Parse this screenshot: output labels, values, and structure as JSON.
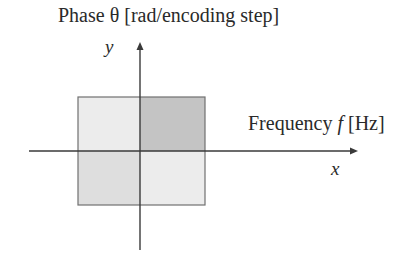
{
  "diagram": {
    "title": "Phase θ [rad/encoding step]",
    "y_axis_label": "y",
    "x_axis_title_prefix": "Frequency ",
    "x_axis_title_symbol": "f",
    "x_axis_title_suffix": " [Hz]",
    "x_axis_label": "x",
    "quadrants": {
      "top_left": {
        "shade": "very-light",
        "color": "#ececec"
      },
      "top_right": {
        "shade": "dark",
        "color": "#c4c4c4"
      },
      "bottom_left": {
        "shade": "medium-light",
        "color": "#dedede"
      },
      "bottom_right": {
        "shade": "very-light",
        "color": "#ececec"
      }
    },
    "axis_color": "#3a3a3a",
    "border_color": "#707070"
  }
}
